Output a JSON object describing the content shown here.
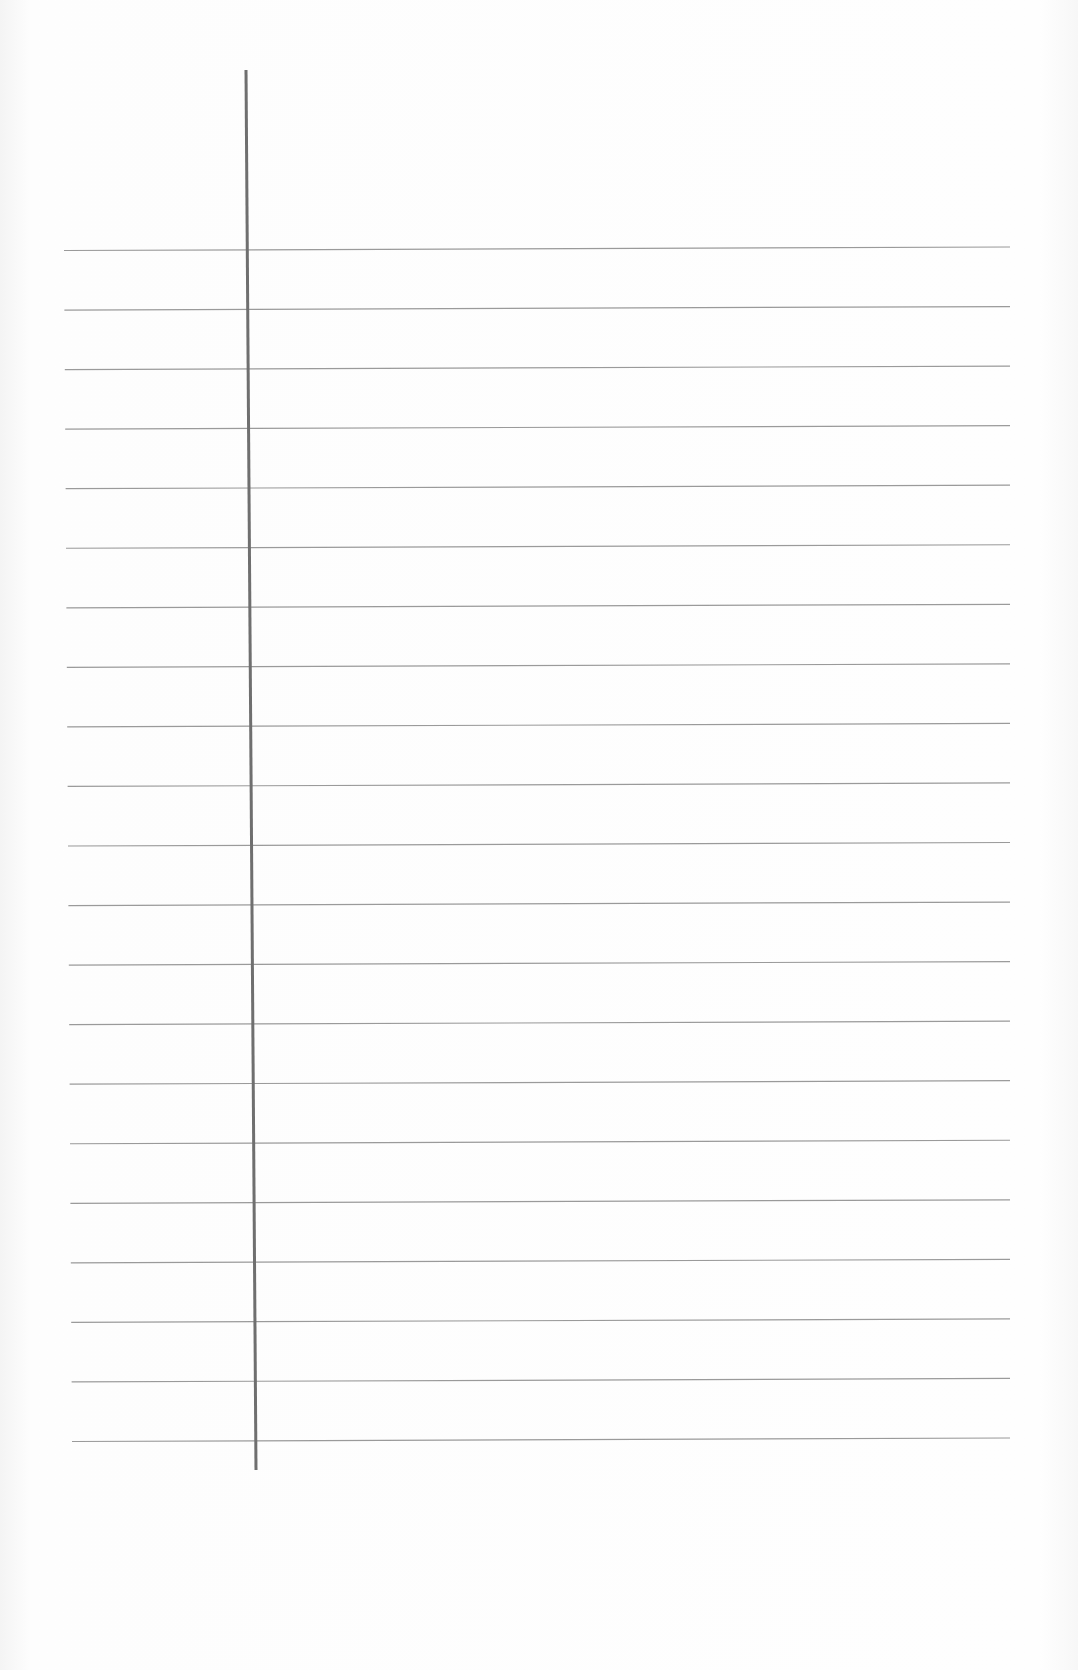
{
  "document": {
    "type": "ruled-paper",
    "text": "",
    "line_count": 21,
    "colors": {
      "paper": "#fdfdfd",
      "rule_line": "#9a9a9a",
      "margin_line": "#6f6f6f"
    }
  }
}
